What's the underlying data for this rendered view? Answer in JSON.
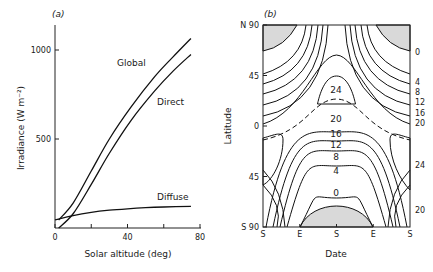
{
  "chart_data": [
    {
      "panel": "(a)",
      "type": "line",
      "title": "",
      "xlabel": "Solar altitude (deg)",
      "ylabel": "Irradiance (W m⁻²)",
      "xlim": [
        0,
        80
      ],
      "ylim": [
        0,
        1130
      ],
      "xticks": [
        0,
        20,
        40,
        60,
        80
      ],
      "xtick_labels": [
        "0",
        "",
        "40",
        "",
        "80"
      ],
      "yticks": [
        500,
        1000
      ],
      "ytick_labels": [
        "500",
        "1000"
      ],
      "grid": false,
      "series": [
        {
          "name": "Global",
          "x": [
            2,
            10,
            20,
            30,
            42,
            55,
            65,
            75
          ],
          "y": [
            45,
            140,
            320,
            500,
            680,
            850,
            960,
            1065
          ]
        },
        {
          "name": "Direct",
          "x": [
            2,
            10,
            20,
            30,
            42,
            55,
            65,
            75
          ],
          "y": [
            0,
            80,
            245,
            420,
            605,
            770,
            880,
            975
          ]
        },
        {
          "name": "Diffuse",
          "x": [
            0,
            10,
            20,
            30,
            40,
            50,
            60,
            75
          ],
          "y": [
            45,
            70,
            88,
            100,
            108,
            114,
            118,
            122
          ]
        }
      ],
      "annotations": [
        "Global",
        "Direct",
        "Diffuse"
      ]
    },
    {
      "panel": "(b)",
      "type": "contour",
      "title": "",
      "xlabel": "Date",
      "ylabel": "Latitude",
      "xtick_labels": [
        "S",
        "E",
        "S",
        "E",
        "S"
      ],
      "ytick_labels": [
        "N 90",
        "45",
        "0",
        "45",
        "S 90"
      ],
      "yticks": [
        90,
        45,
        0,
        -45,
        -90
      ],
      "contour_levels": [
        0,
        4,
        8,
        12,
        16,
        20,
        24
      ],
      "right_labels": [
        "0",
        "4",
        "8",
        "12",
        "16",
        "20",
        "24",
        "20"
      ],
      "inner_labels": [
        "24",
        "20",
        "16",
        "12",
        "8",
        "4",
        "0"
      ],
      "shaded": "zero-daylength (polar night) regions",
      "dashed_line": "declination / subsolar boundary"
    }
  ]
}
